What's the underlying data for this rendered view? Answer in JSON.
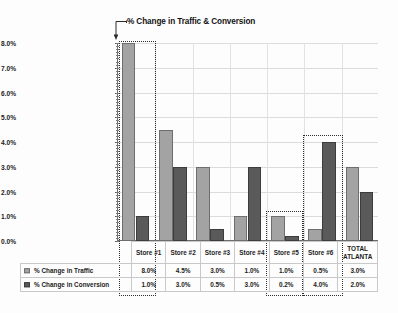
{
  "chart_data": {
    "type": "bar",
    "title": "% Change in Traffic & Conversion",
    "xlabel": "",
    "ylabel": "",
    "ylim": [
      0,
      8
    ],
    "ytick_labels": [
      "0.0%",
      "1.0%",
      "2.0%",
      "3.0%",
      "4.0%",
      "5.0%",
      "6.0%",
      "7.0%",
      "8.0%"
    ],
    "ytick_values": [
      0,
      1,
      2,
      3,
      4,
      5,
      6,
      7,
      8
    ],
    "grid": true,
    "legend_position": "bottom-table",
    "categories": [
      "Store #1",
      "Store #2",
      "Store #3",
      "Store #4",
      "Store #5",
      "Store #6",
      "TOTAL ATLANTA"
    ],
    "category_lines": [
      "Store #1",
      "Store #2",
      "Store #3",
      "Store #4",
      "Store #5",
      "Store #6",
      "TOTAL\nATLANTA"
    ],
    "series": [
      {
        "name": "% Change in Traffic",
        "color": "#a3a3a3",
        "values": [
          8.0,
          4.5,
          3.0,
          1.0,
          1.0,
          0.5,
          3.0
        ],
        "labels": [
          "8.0%",
          "4.5%",
          "3.0%",
          "1.0%",
          "1.0%",
          "0.5%",
          "3.0%"
        ]
      },
      {
        "name": "% Change in Conversion",
        "color": "#5a5a5a",
        "values": [
          1.0,
          3.0,
          0.5,
          3.0,
          0.2,
          4.0,
          2.0
        ],
        "labels": [
          "1.0%",
          "3.0%",
          "0.5%",
          "3.0%",
          "0.2%",
          "4.0%",
          "2.0%"
        ]
      }
    ],
    "annotations": [
      {
        "type": "selection-box",
        "target": "Store #1"
      },
      {
        "type": "selection-box",
        "target": "Store #5"
      },
      {
        "type": "selection-box",
        "target": "Store #6"
      },
      {
        "type": "title-leader-arrow",
        "target": "Store #1"
      }
    ]
  },
  "table": {
    "header_labels": [
      "Store #1",
      "Store #2",
      "Store #3",
      "Store #4",
      "Store #5",
      "Store #6",
      "TOTAL",
      "ATLANTA"
    ],
    "row_traffic_label": "% Change in Traffic",
    "row_conversion_label": "% Change in Conversion",
    "row_traffic_values": [
      "8.0%",
      "4.5%",
      "3.0%",
      "1.0%",
      "1.0%",
      "0.5%",
      "3.0%"
    ],
    "row_conversion_values": [
      "1.0%",
      "3.0%",
      "0.5%",
      "3.0%",
      "0.2%",
      "4.0%",
      "2.0%"
    ]
  },
  "colors": {
    "traffic": "#a3a3a3",
    "conversion": "#5a5a5a",
    "axis": "#6d6d6d",
    "grid": "#dcdcdc",
    "selection": "#2c2c2c"
  }
}
